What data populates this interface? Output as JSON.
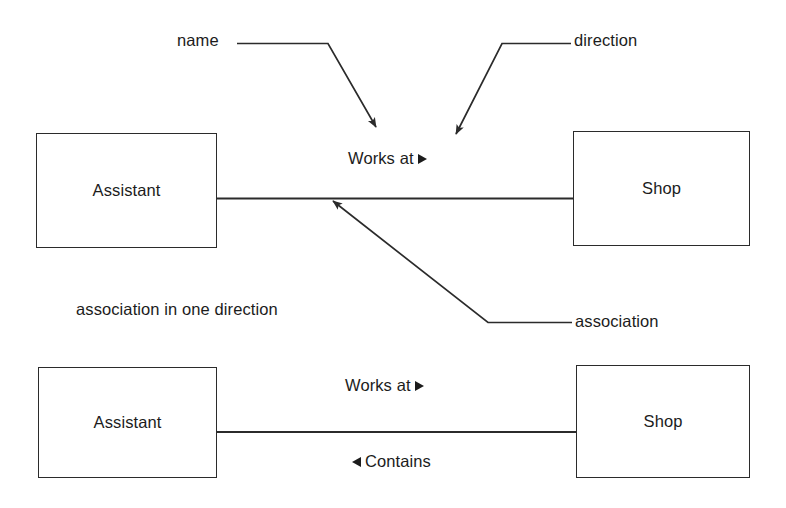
{
  "diagram": {
    "type": "uml-class-association-diagram",
    "caption": "association in one direction",
    "colors": {
      "background": "#ffffff",
      "line": "#2b2b2b",
      "text": "#1c1c1c"
    },
    "annotations": [
      {
        "id": "name",
        "label": "name",
        "points_to": "association-name-label"
      },
      {
        "id": "direction",
        "label": "direction",
        "points_to": "direction-arrow-glyph"
      },
      {
        "id": "association",
        "label": "association",
        "points_to": "association-connector-line"
      }
    ],
    "upper": {
      "left_class": "Assistant",
      "right_class": "Shop",
      "association_label": "Works at",
      "association_direction_glyph": "triangle-right"
    },
    "lower": {
      "left_class": "Assistant",
      "right_class": "Shop",
      "association_label_top": "Works at",
      "association_top_glyph": "triangle-right",
      "association_label_bottom": "Contains",
      "association_bottom_glyph": "triangle-left"
    }
  }
}
